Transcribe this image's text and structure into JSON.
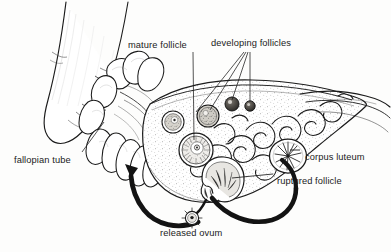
{
  "figure": {
    "type": "anatomical-line-illustration",
    "background_color": "#fdfdfc",
    "ink_color": "#1b1b1b",
    "label_font_size_px": 9.3
  },
  "labels": [
    {
      "id": "mature-follicle",
      "text": "mature follicle",
      "x": 128,
      "y": 40,
      "leader": "vertical line down to follicle at (196,150)"
    },
    {
      "id": "developing-follicles",
      "text": "developing follicles",
      "x": 211,
      "y": 38,
      "leader": "three lines fanning down to follicles"
    },
    {
      "id": "fallopian-tube",
      "text": "fallopian tube",
      "x": 14,
      "y": 155,
      "leader": "diagonal line up-right to tube at (92,128)"
    },
    {
      "id": "corpus-luteum",
      "text": "corpus luteum",
      "x": 305,
      "y": 152,
      "leader": "short dash left to starburst body at (288,156)"
    },
    {
      "id": "ruptured-follicle",
      "text": "ruptured follicle",
      "x": 277,
      "y": 176,
      "leader": "line left to ruptured follicle at (222,180)"
    },
    {
      "id": "released-ovum",
      "text": "released ovum",
      "x": 160,
      "y": 228,
      "leader": "ovum circle directly above text at (192,218)"
    }
  ],
  "structures": [
    {
      "id": "uterus-body",
      "name": "uterine horn / body",
      "region": "left"
    },
    {
      "id": "fimbriae",
      "name": "fimbriae of fallopian tube",
      "region": "center-left"
    },
    {
      "id": "ovary",
      "name": "ovary (sectioned)",
      "region": "center-right"
    },
    {
      "id": "developing-follicle-1",
      "name": "developing follicle",
      "cx": 232,
      "cy": 104,
      "r": 7
    },
    {
      "id": "developing-follicle-2",
      "name": "developing follicle",
      "cx": 250,
      "cy": 106,
      "r": 5
    },
    {
      "id": "developing-follicle-3",
      "name": "developing follicle",
      "cx": 208,
      "cy": 116,
      "r": 11
    },
    {
      "id": "mature-follicle-body",
      "name": "mature follicle",
      "cx": 196,
      "cy": 150,
      "r": 17
    },
    {
      "id": "intermediate-follicle",
      "name": "follicle",
      "cx": 173,
      "cy": 122,
      "r": 11
    },
    {
      "id": "corpus-luteum-body",
      "name": "corpus luteum",
      "cx": 288,
      "cy": 156,
      "r": 18
    },
    {
      "id": "ruptured-follicle-body",
      "name": "ruptured follicle",
      "cx": 222,
      "cy": 182,
      "r": 20
    },
    {
      "id": "ovum",
      "name": "released ovum",
      "cx": 192,
      "cy": 218,
      "r": 6
    },
    {
      "id": "medulla-vessels",
      "name": "ovarian medulla blood vessels",
      "region": "right"
    },
    {
      "id": "hilum",
      "name": "ovarian hilum / suspensory ligament",
      "region": "far-right"
    }
  ],
  "arrows": [
    {
      "id": "ovulation-arrow",
      "description": "thick curved arrow from ruptured follicle down around to released ovum",
      "from": "ruptured-follicle-body",
      "to": "ovum"
    },
    {
      "id": "ovum-pickup-arrow",
      "description": "thick curved arrow from released ovum sweeping left up into the fimbriae",
      "from": "ovum",
      "to": "fimbriae"
    }
  ]
}
